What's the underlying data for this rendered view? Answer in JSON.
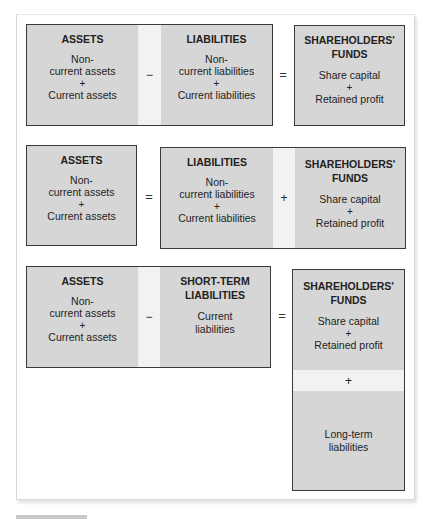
{
  "row1": {
    "assets": {
      "title": "ASSETS",
      "line1": "Non-",
      "line2": "current assets",
      "plus": "+",
      "line3": "Current assets"
    },
    "operator_minus": "−",
    "liabilities": {
      "title": "LIABILITIES",
      "line1": "Non-",
      "line2": "current liabilities",
      "plus": "+",
      "line3": "Current liabilities"
    },
    "operator_equals": "=",
    "funds": {
      "title1": "SHAREHOLDERS'",
      "title2": "FUNDS",
      "line1": "Share capital",
      "plus": "+",
      "line2": "Retained profit"
    }
  },
  "row2": {
    "assets": {
      "title": "ASSETS",
      "line1": "Non-",
      "line2": "current assets",
      "plus": "+",
      "line3": "Current assets"
    },
    "operator_equals": "=",
    "liabilities": {
      "title": "LIABILITIES",
      "line1": "Non-",
      "line2": "current liabilities",
      "plus": "+",
      "line3": "Current liabilities"
    },
    "operator_plus": "+",
    "funds": {
      "title1": "SHAREHOLDERS'",
      "title2": "FUNDS",
      "line1": "Share capital",
      "plus": "+",
      "line2": "Retained profit"
    }
  },
  "row3": {
    "assets": {
      "title": "ASSETS",
      "line1": "Non-",
      "line2": "current assets",
      "plus": "+",
      "line3": "Current assets"
    },
    "operator_minus": "−",
    "short_term": {
      "title1": "SHORT-TERM",
      "title2": "LIABILITIES",
      "line1": "Current",
      "line2": "liabilities"
    },
    "operator_equals": "=",
    "funds": {
      "title1": "SHAREHOLDERS'",
      "title2": "FUNDS",
      "line1": "Share capital",
      "plus": "+",
      "line2": "Retained profit"
    },
    "operator_plus": "+",
    "long_term": {
      "line1": "Long-term",
      "line2": "liabilities"
    }
  }
}
